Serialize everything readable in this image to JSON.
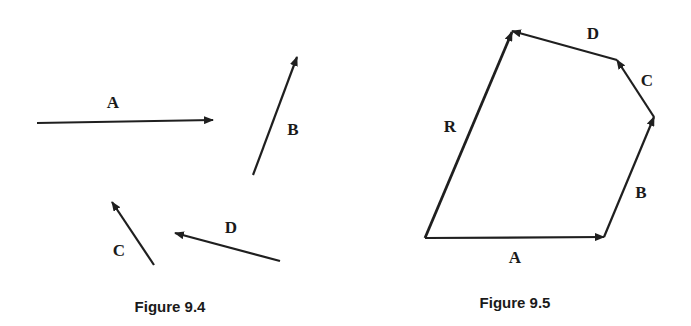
{
  "figures": [
    {
      "caption": "Figure 9.4",
      "vectors": [
        {
          "label": "A",
          "from": [
            37,
            123
          ],
          "to": [
            213,
            120
          ],
          "label_pos": [
            113,
            108
          ]
        },
        {
          "label": "B",
          "from": [
            253,
            175
          ],
          "to": [
            297,
            57
          ],
          "label_pos": [
            293,
            135
          ]
        },
        {
          "label": "C",
          "from": [
            154,
            265
          ],
          "to": [
            112,
            202
          ],
          "label_pos": [
            119,
            256
          ]
        },
        {
          "label": "D",
          "from": [
            280,
            261
          ],
          "to": [
            175,
            233
          ],
          "label_pos": [
            231,
            233
          ]
        }
      ]
    },
    {
      "caption": "Figure 9.5",
      "vectors": [
        {
          "label": "A",
          "from": [
            425,
            238
          ],
          "to": [
            604,
            237
          ],
          "label_pos": [
            515,
            263
          ]
        },
        {
          "label": "B",
          "from": [
            604,
            237
          ],
          "to": [
            654,
            117
          ],
          "label_pos": [
            641,
            198
          ]
        },
        {
          "label": "C",
          "from": [
            654,
            117
          ],
          "to": [
            617,
            60
          ],
          "label_pos": [
            647,
            86
          ]
        },
        {
          "label": "D",
          "from": [
            617,
            60
          ],
          "to": [
            512,
            31
          ],
          "label_pos": [
            593,
            39
          ]
        },
        {
          "label": "R",
          "from": [
            425,
            238
          ],
          "to": [
            512,
            32
          ],
          "label_pos": [
            450,
            132
          ]
        }
      ]
    }
  ]
}
